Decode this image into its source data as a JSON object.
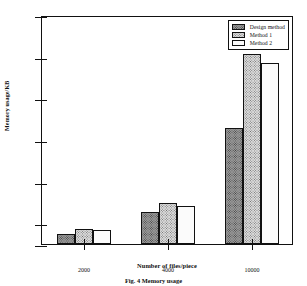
{
  "chart_data": {
    "type": "bar",
    "title": "",
    "xlabel": "Number of files/piece",
    "ylabel": "Memory usage/KB",
    "categories": [
      "2000",
      "4000",
      "10000"
    ],
    "series": [
      {
        "name": "Design method",
        "values": [
          1500,
          2550,
          6550
        ]
      },
      {
        "name": "Method 1",
        "values": [
          1700,
          2980,
          10130
        ]
      },
      {
        "name": "Method 2",
        "values": [
          1690,
          2830,
          9680
        ]
      }
    ],
    "ylim": [
      1000,
      12000
    ],
    "yticks": [
      "1000",
      "2000",
      "4000",
      "6000",
      "8000",
      "10000",
      "12000"
    ],
    "ytick_values": [
      1000,
      2000,
      4000,
      6000,
      8000,
      10000,
      12000
    ],
    "xticks": [
      "2000",
      "4000",
      "10000"
    ],
    "grid": false,
    "legend_position": "top-right"
  },
  "caption": "Fig. 4  Memory usage",
  "colors": {
    "axis": "#111111",
    "design_method": "#9a9a9a",
    "method_1": "#dcdcdc",
    "method_2": "#fbfbfb"
  }
}
